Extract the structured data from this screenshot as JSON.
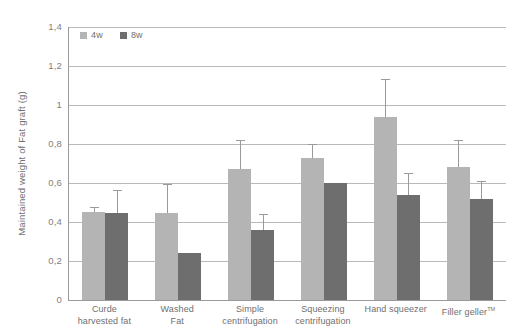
{
  "chart_data": {
    "type": "bar",
    "title": "",
    "subtitle": "",
    "xlabel": "",
    "ylabel": "Maintained weight of Fat graft (g)",
    "ylim": [
      0,
      1.4
    ],
    "ytick_step": 0.2,
    "yticks": [
      "1,4",
      "1,2",
      "1",
      "0,8",
      "0,6",
      "0,4",
      "0,2",
      "0"
    ],
    "ytick_values": [
      1.4,
      1.2,
      1.0,
      0.8,
      0.6,
      0.4,
      0.2,
      0
    ],
    "grid": true,
    "grid_axis": "y",
    "legend_position": "top-left",
    "categories": [
      "Curde harvested fat",
      "Washed Fat",
      "Simple centrifugation",
      "Squeezing centrifugation",
      "Hand squeezer",
      "Filler geller™"
    ],
    "category_lines": [
      [
        "Curde",
        "harvested fat"
      ],
      [
        "Washed",
        "Fat"
      ],
      [
        "Simple",
        "centrifugation"
      ],
      [
        "Squeezing",
        "centrifugation"
      ],
      [
        "Hand squeezer"
      ],
      [
        "Filler geller"
      ]
    ],
    "series": [
      {
        "name": "4w",
        "color": "#b4b4b4",
        "values": [
          0.45,
          0.445,
          0.67,
          0.73,
          0.94,
          0.68
        ],
        "errors": [
          0.02,
          0.145,
          0.145,
          0.065,
          0.19,
          0.135
        ]
      },
      {
        "name": "8w",
        "color": "#6e6e6e",
        "values": [
          0.445,
          0.24,
          0.36,
          0.6,
          0.54,
          0.52
        ],
        "errors": [
          0.115,
          0.0,
          0.075,
          0.0,
          0.105,
          0.085
        ]
      }
    ]
  },
  "colors": {
    "series_4w": "#b4b4b4",
    "series_8w": "#6e6e6e",
    "gridline": "#b9b9b9",
    "axis": "#9a9a9a",
    "text": "#6f6f6f",
    "background": "#ffffff"
  },
  "legend": {
    "items": [
      {
        "label": "4w",
        "swatch": "legend-swatch-4w"
      },
      {
        "label": "8w",
        "swatch": "legend-swatch-8w"
      }
    ]
  }
}
